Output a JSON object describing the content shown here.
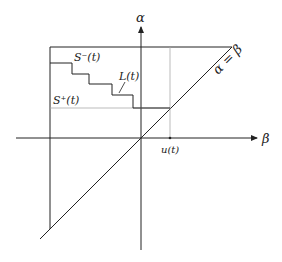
{
  "diagram": {
    "axes": {
      "vertical_label": "α",
      "horizontal_label": "β"
    },
    "labels": {
      "s_minus": "S⁻(t)",
      "s_plus": "S⁺(t)",
      "l_of_t": "L(t)",
      "u_of_t": "u(t)",
      "diagonal": "α = β"
    },
    "colors": {
      "line": "#222222",
      "dotted": "#aaaaaa",
      "background": "#ffffff"
    }
  }
}
